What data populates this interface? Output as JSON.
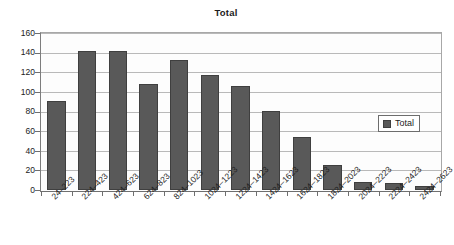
{
  "chart_data": {
    "type": "bar",
    "title": "Total",
    "xlabel": "",
    "ylabel": "",
    "ylim": [
      0,
      160
    ],
    "ytick_step": 20,
    "yticks": [
      160,
      140,
      120,
      100,
      80,
      60,
      40,
      20,
      0
    ],
    "grid": true,
    "legend_position": "right-inside",
    "legend": [
      "Total"
    ],
    "bar_color": "#595959",
    "bar_border_color": "#3f3f3f",
    "gridline_color": "#b9b9b9",
    "axis_color": "#6f6f6f",
    "categories": [
      "24–223",
      "224–423",
      "424–623",
      "624–823",
      "824–1023",
      "1024–1223",
      "1224–1423",
      "1424–1623",
      "1624–1823",
      "1824–2023",
      "2024–2223",
      "2224–2423",
      "2424–2623"
    ],
    "series": [
      {
        "name": "Total",
        "values": [
          91,
          142,
          142,
          108,
          133,
          117,
          106,
          81,
          54,
          26,
          8,
          7,
          4
        ]
      }
    ]
  }
}
